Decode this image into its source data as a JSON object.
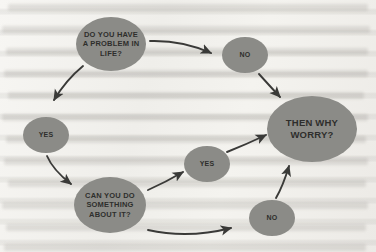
{
  "diagram": {
    "node_fill_color": "#8b8b87",
    "node_text_color": "#2e2e2c",
    "arrow_color": "#3a3a38",
    "background_color": "#f2f1ee",
    "nodes": [
      {
        "id": "question-problem",
        "label": "DO YOU HAVE A PROBLEM IN LIFE?",
        "lines": [
          "DO YOU HAVE",
          "A PROBLEM IN",
          "LIFE?"
        ],
        "size": "med",
        "cx": 111,
        "cy": 44,
        "rx": 35,
        "ry": 27
      },
      {
        "id": "answer-no-top",
        "label": "NO",
        "lines": [
          "NO"
        ],
        "size": "small",
        "cx": 245,
        "cy": 55,
        "rx": 23,
        "ry": 18
      },
      {
        "id": "answer-yes-left",
        "label": "YES",
        "lines": [
          "YES"
        ],
        "size": "small",
        "cx": 46,
        "cy": 135,
        "rx": 23,
        "ry": 18
      },
      {
        "id": "question-can-do",
        "label": "CAN YOU DO SOMETHING ABOUT IT?",
        "lines": [
          "CAN YOU DO",
          "SOMETHING",
          "ABOUT IT?"
        ],
        "size": "med",
        "cx": 110,
        "cy": 205,
        "rx": 36,
        "ry": 28
      },
      {
        "id": "answer-yes-middle",
        "label": "YES",
        "lines": [
          "YES"
        ],
        "size": "small",
        "cx": 207,
        "cy": 164,
        "rx": 23,
        "ry": 18
      },
      {
        "id": "answer-no-bottom",
        "label": "NO",
        "lines": [
          "NO"
        ],
        "size": "small",
        "cx": 272,
        "cy": 218,
        "rx": 23,
        "ry": 18
      },
      {
        "id": "conclusion-why-worry",
        "label": "THEN WHY WORRY?",
        "lines": [
          "THEN WHY",
          "WORRY?"
        ],
        "size": "large",
        "cx": 312,
        "cy": 129,
        "rx": 45,
        "ry": 33
      }
    ],
    "edges": [
      {
        "id": "edge-problem-to-no-top",
        "from": "question-problem",
        "to": "answer-no-top"
      },
      {
        "id": "edge-problem-to-yes-left",
        "from": "question-problem",
        "to": "answer-yes-left"
      },
      {
        "id": "edge-no-top-to-worry",
        "from": "answer-no-top",
        "to": "conclusion-why-worry"
      },
      {
        "id": "edge-yes-left-to-can-do",
        "from": "answer-yes-left",
        "to": "question-can-do"
      },
      {
        "id": "edge-can-do-to-yes-mid",
        "from": "question-can-do",
        "to": "answer-yes-middle"
      },
      {
        "id": "edge-can-do-to-no-bottom",
        "from": "question-can-do",
        "to": "answer-no-bottom"
      },
      {
        "id": "edge-yes-mid-to-worry",
        "from": "answer-yes-middle",
        "to": "conclusion-why-worry"
      },
      {
        "id": "edge-no-bottom-to-worry",
        "from": "answer-no-bottom",
        "to": "conclusion-why-worry"
      }
    ]
  }
}
